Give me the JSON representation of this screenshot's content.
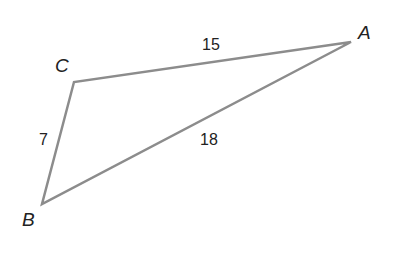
{
  "diagram": {
    "type": "triangle",
    "stroke_color": "#8c8c8c",
    "text_color": "#222222",
    "vertices": [
      {
        "name": "A",
        "x": 351,
        "y": 42
      },
      {
        "name": "B",
        "x": 42,
        "y": 204
      },
      {
        "name": "C",
        "x": 74,
        "y": 82
      }
    ],
    "labels": {
      "A": "A",
      "B": "B",
      "C": "C"
    },
    "sides": {
      "CA": "15",
      "CB": "7",
      "AB": "18"
    }
  }
}
